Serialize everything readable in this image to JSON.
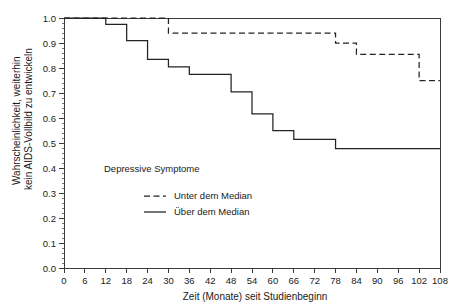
{
  "chart_data": {
    "type": "line",
    "subtype": "kaplan-meier-step",
    "title": "",
    "xlabel": "Zeit (Monate) seit Studienbeginn",
    "ylabel": "Wahrscheinlichkeit, weiterhin kein AIDS-Vollbild zu entwickeln",
    "ylabel_lines": [
      "Wahrscheinlichkeit, weiterhin",
      "kein AIDS-Vollbild zu entwickeln"
    ],
    "xlim": [
      0,
      108
    ],
    "ylim": [
      0.0,
      1.0
    ],
    "grid": false,
    "legend_position": "center-left-inside",
    "legend_title": "Depressive Symptome",
    "xticks": [
      0,
      6,
      12,
      18,
      24,
      30,
      36,
      42,
      48,
      54,
      60,
      66,
      72,
      78,
      84,
      90,
      96,
      102,
      108
    ],
    "xtick_labels": [
      "0",
      "6",
      "12",
      "18",
      "24",
      "30",
      "36",
      "42",
      "48",
      "54",
      "60",
      "66",
      "72",
      "78",
      "84",
      "90",
      "96",
      "102",
      "108"
    ],
    "yticks": [
      0.0,
      0.1,
      0.2,
      0.3,
      0.4,
      0.5,
      0.6,
      0.7,
      0.8,
      0.9,
      1.0
    ],
    "ytick_labels": [
      "0.0",
      "0.1",
      "0.2",
      "0.3",
      "0.4",
      "0.5",
      "0.6",
      "0.7",
      "0.8",
      "0.9",
      "1.0"
    ],
    "series": [
      {
        "name": "Unter dem Median",
        "style": "dashed",
        "color": "#232323",
        "x": [
          0,
          30,
          30,
          78,
          78,
          84,
          84,
          102,
          102,
          108
        ],
        "y": [
          1.0,
          1.0,
          0.94,
          0.94,
          0.9,
          0.9,
          0.855,
          0.855,
          0.75,
          0.75
        ],
        "steps": [
          {
            "month": 0,
            "probability": 1.0
          },
          {
            "month": 30,
            "probability": 0.94
          },
          {
            "month": 78,
            "probability": 0.9
          },
          {
            "month": 84,
            "probability": 0.855
          },
          {
            "month": 102,
            "probability": 0.75
          }
        ]
      },
      {
        "name": "Über dem Median",
        "style": "solid",
        "color": "#232323",
        "x": [
          0,
          12,
          12,
          18,
          18,
          24,
          24,
          30,
          30,
          36,
          36,
          48,
          48,
          54,
          54,
          60,
          60,
          66,
          66,
          78,
          78,
          90,
          90,
          108
        ],
        "y": [
          1.0,
          1.0,
          0.975,
          0.975,
          0.91,
          0.91,
          0.835,
          0.835,
          0.805,
          0.805,
          0.775,
          0.775,
          0.705,
          0.705,
          0.617,
          0.617,
          0.55,
          0.55,
          0.515,
          0.515,
          0.478,
          0.478,
          0.478,
          0.478
        ],
        "steps": [
          {
            "month": 0,
            "probability": 1.0
          },
          {
            "month": 12,
            "probability": 0.975
          },
          {
            "month": 18,
            "probability": 0.91
          },
          {
            "month": 24,
            "probability": 0.835
          },
          {
            "month": 30,
            "probability": 0.805
          },
          {
            "month": 36,
            "probability": 0.775
          },
          {
            "month": 48,
            "probability": 0.705
          },
          {
            "month": 54,
            "probability": 0.617
          },
          {
            "month": 60,
            "probability": 0.55
          },
          {
            "month": 66,
            "probability": 0.515
          },
          {
            "month": 78,
            "probability": 0.478
          },
          {
            "month": 90,
            "probability": 0.478
          }
        ]
      }
    ],
    "legend_entries": [
      {
        "label": "Unter dem Median",
        "style": "dashed"
      },
      {
        "label": "Über dem Median",
        "style": "solid"
      }
    ]
  }
}
